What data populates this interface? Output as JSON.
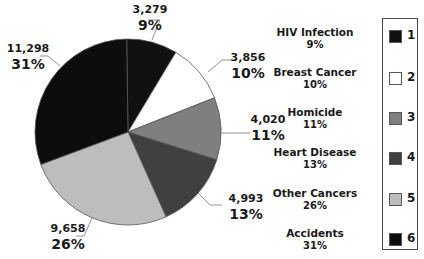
{
  "chart_data": {
    "type": "pie",
    "title": "",
    "slices": [
      {
        "label": "HIV Infection",
        "key": "1",
        "value": 3279,
        "value_label": "3,279",
        "percent": 9,
        "percent_label": "9%",
        "color": "#111111"
      },
      {
        "label": "Breast Cancer",
        "key": "2",
        "value": 3856,
        "value_label": "3,856",
        "percent": 10,
        "percent_label": "10%",
        "color": "#ffffff"
      },
      {
        "label": "Homicide",
        "key": "3",
        "value": 4020,
        "value_label": "4,020",
        "percent": 11,
        "percent_label": "11%",
        "color": "#7f7f7f"
      },
      {
        "label": "Heart Disease",
        "key": "4",
        "value": 4993,
        "value_label": "4,993",
        "percent": 13,
        "percent_label": "13%",
        "color": "#404040"
      },
      {
        "label": "Other Cancers",
        "key": "5",
        "value": 9658,
        "value_label": "9,658",
        "percent": 26,
        "percent_label": "26%",
        "color": "#bdbdbd"
      },
      {
        "label": "Accidents",
        "key": "6",
        "value": 11298,
        "value_label": "11,298",
        "percent": 31,
        "percent_label": "31%",
        "color": "#0d0d0d"
      }
    ],
    "legend_position": "right"
  }
}
